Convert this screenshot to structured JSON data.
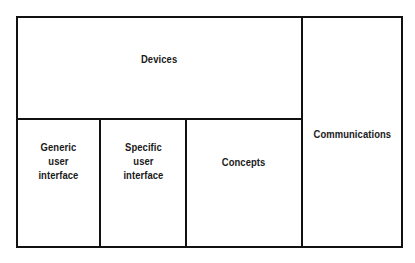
{
  "diagram": {
    "blocks": [
      {
        "id": "devices",
        "label": "Devices"
      },
      {
        "id": "communications",
        "label": "Communications"
      },
      {
        "id": "generic-ui",
        "label": "Generic\nuser\ninterface"
      },
      {
        "id": "specific-ui",
        "label": "Specific\nuser\ninterface"
      },
      {
        "id": "concepts",
        "label": "Concepts"
      }
    ],
    "colors": {
      "line": "#111111",
      "text": "#1a1a1a",
      "background": "#ffffff"
    }
  }
}
